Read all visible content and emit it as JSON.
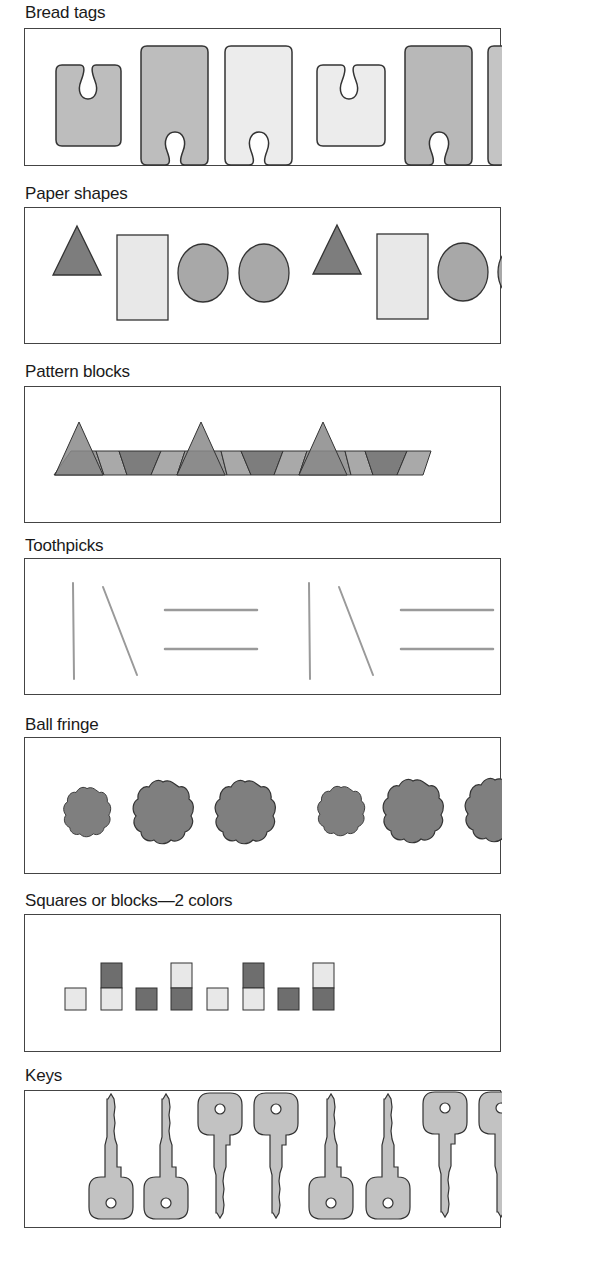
{
  "figure": {
    "sections": [
      {
        "id": "bread-tags",
        "title": "Bread tags",
        "pattern": [
          "small-dark",
          "tall-dark",
          "tall-light",
          "small-light",
          "tall-dark",
          "tall-dark"
        ]
      },
      {
        "id": "paper-shapes",
        "title": "Paper shapes",
        "pattern": [
          "triangle",
          "rectangle",
          "circle",
          "circle",
          "triangle",
          "rectangle",
          "circle",
          "circle"
        ]
      },
      {
        "id": "pattern-blocks",
        "title": "Pattern blocks",
        "pattern": [
          "triangle",
          "trapezoid",
          "trapezoid",
          "trapezoid",
          "triangle",
          "trapezoid",
          "trapezoid",
          "trapezoid",
          "triangle",
          "trapezoid",
          "trapezoid",
          "trapezoid"
        ]
      },
      {
        "id": "toothpicks",
        "title": "Toothpicks",
        "pattern": [
          "vertical",
          "slanted",
          "horizontal-pair",
          "vertical",
          "slanted",
          "horizontal-pair"
        ]
      },
      {
        "id": "ball-fringe",
        "title": "Ball fringe",
        "pattern": [
          "small",
          "large",
          "large",
          "small",
          "large",
          "large"
        ]
      },
      {
        "id": "squares-blocks",
        "title": "Squares or blocks—2 colors",
        "pattern": [
          "light",
          "dark-over-light",
          "dark",
          "light-over-dark",
          "light",
          "dark-over-light",
          "dark",
          "light-over-dark"
        ]
      },
      {
        "id": "keys",
        "title": "Keys",
        "pattern": [
          "head-down",
          "head-down",
          "head-up",
          "head-up",
          "head-down",
          "head-down",
          "head-up",
          "head-up"
        ]
      }
    ]
  },
  "colors": {
    "dark": "#7a7a7a",
    "medium": "#a6a6a6",
    "light": "#e6e6e6",
    "outline": "#333333"
  }
}
